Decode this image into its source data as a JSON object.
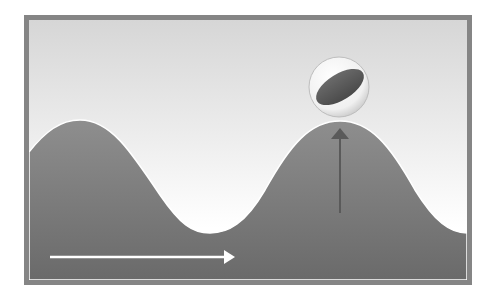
{
  "diagram": {
    "title": "",
    "frame": {
      "x": 24,
      "y": 15,
      "width": 448,
      "height": 270,
      "border_color": "#858585",
      "border_width": 5
    },
    "sky": {
      "top_color": "#d6d6d6",
      "bottom_color": "#ffffff"
    },
    "wave": {
      "fill_top_color": "#8e8e8e",
      "fill_bottom_color": "#6c6c6c",
      "edge_color": "#ffffff",
      "left_y": 152,
      "crests": [
        {
          "x": 80,
          "y": 120
        },
        {
          "x": 340,
          "y": 121
        }
      ],
      "troughs": [
        {
          "x": 210,
          "y": 233
        },
        {
          "x": 467,
          "y": 233
        }
      ]
    },
    "ball": {
      "cx": 339,
      "cy": 87,
      "r": 30,
      "stripe_color": "#555555",
      "shell_color": "#f4f4f4"
    },
    "arrows": [
      {
        "name": "propagation-arrow",
        "direction": "right",
        "x1": 50,
        "y1": 257,
        "x2": 234,
        "y2": 257,
        "color": "#ffffff"
      },
      {
        "name": "displacement-arrow",
        "direction": "up",
        "x1": 340,
        "y1": 213,
        "x2": 340,
        "y2": 130,
        "color": "#555555"
      }
    ]
  }
}
